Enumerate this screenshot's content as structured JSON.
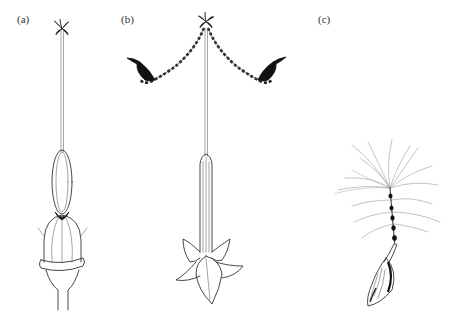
{
  "figure": {
    "background": "#ffffff",
    "ink_color": "#111111",
    "panels": [
      {
        "id": "a",
        "label": "(a)",
        "subject": "stamen/style column with anther tube, ovary and collar"
      },
      {
        "id": "b",
        "label": "(b)",
        "subject": "style with branched garland-like arms ending in dark leaf-shaped tips, over a tubular corolla with five-pointed star base"
      },
      {
        "id": "c",
        "label": "(c)",
        "subject": "plumed seed with beaded stalk and elongated hatched seed body"
      }
    ]
  }
}
